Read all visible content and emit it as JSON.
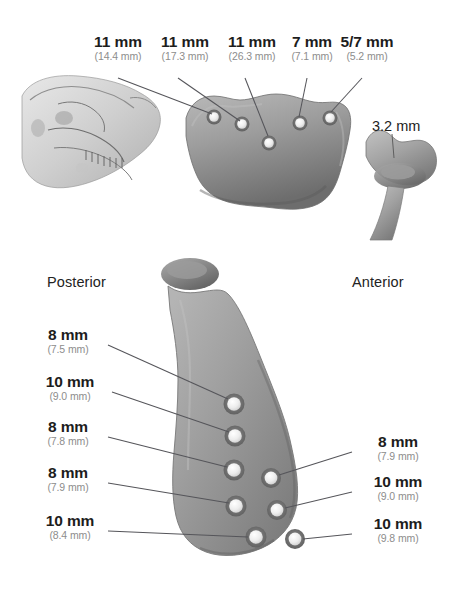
{
  "figure": {
    "background_color": "#ffffff",
    "bone_fill": "#9a9a9a",
    "bone_shadow": "#6f6f6f",
    "bone_highlight": "#bdbdbd",
    "hole_rim": "#6a6a6a",
    "hole_fill": "#f2f2f2",
    "leader_color": "#55555a",
    "primary_text_color": "#1d1d1d",
    "secondary_text_color": "#8d8d8d"
  },
  "top_panel": {
    "skull_image_name": "lateral-skull-radiograph",
    "condyle_fragment_name": "condylar-head-fragment",
    "fragment_measurement": "3.2 mm",
    "measurements": [
      {
        "primary": "11 mm",
        "secondary": "(14.4 mm)"
      },
      {
        "primary": "11 mm",
        "secondary": "(17.3 mm)"
      },
      {
        "primary": "11 mm",
        "secondary": "(26.3 mm)"
      },
      {
        "primary": "7 mm",
        "secondary": "(7.1 mm)"
      },
      {
        "primary": "5/7 mm",
        "secondary": "(5.2 mm)"
      }
    ]
  },
  "bottom_panel": {
    "ramus_image_name": "mandibular-ramus-lateral",
    "orientation_left": "Posterior",
    "orientation_right": "Anterior",
    "left_measurements": [
      {
        "primary": "8 mm",
        "secondary": "(7.5 mm)"
      },
      {
        "primary": "10 mm",
        "secondary": "(9.0 mm)"
      },
      {
        "primary": "8 mm",
        "secondary": "(7.8 mm)"
      },
      {
        "primary": "8 mm",
        "secondary": "(7.9 mm)"
      },
      {
        "primary": "10 mm",
        "secondary": "(8.4 mm)"
      }
    ],
    "right_measurements": [
      {
        "primary": "8 mm",
        "secondary": "(7.9 mm)"
      },
      {
        "primary": "10 mm",
        "secondary": "(9.0 mm)"
      },
      {
        "primary": "10 mm",
        "secondary": "(9.8 mm)"
      }
    ]
  }
}
